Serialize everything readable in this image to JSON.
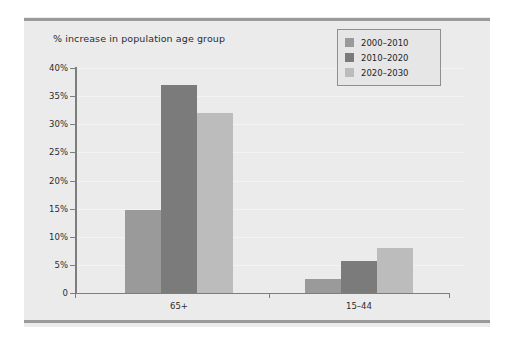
{
  "chart_data": {
    "type": "bar",
    "title": "% increase in population age group",
    "xlabel": "",
    "ylabel": "",
    "categories": [
      "65+",
      "15–44"
    ],
    "series": [
      {
        "name": "2000–2010",
        "color": "#9a9a9a",
        "values": [
          14.8,
          2.5
        ]
      },
      {
        "name": "2010–2020",
        "color": "#7b7b7b",
        "values": [
          37.0,
          5.7
        ]
      },
      {
        "name": "2020–2030",
        "color": "#bcbcbc",
        "values": [
          32.0,
          8.0
        ]
      }
    ],
    "ylim": [
      0,
      40
    ],
    "yticks": [
      0,
      5,
      10,
      15,
      20,
      25,
      30,
      35,
      40
    ],
    "ytick_labels": [
      "0",
      "5%",
      "10%",
      "15%",
      "20%",
      "25%",
      "30%",
      "35%",
      "40%"
    ],
    "grid": true,
    "legend_position": "top-right"
  },
  "legend": {
    "items": [
      {
        "label": "2000–2010",
        "color": "#9a9a9a"
      },
      {
        "label": "2010–2020",
        "color": "#7b7b7b"
      },
      {
        "label": "2020–2030",
        "color": "#bcbcbc"
      }
    ]
  },
  "style": {
    "panel_background": "#ebebeb",
    "figure_background": "#ffffff",
    "axis_color": "#7d7d7d",
    "rule_color": "#9a9a9a",
    "text_color": "#2b2b2b"
  }
}
